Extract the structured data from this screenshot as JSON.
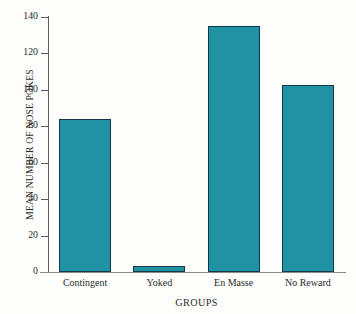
{
  "chart_data": {
    "type": "bar",
    "title": "",
    "subtitle": "",
    "xlabel": "GROUPS",
    "ylabel": "MEAN NUMBER OF NOSE POKES",
    "categories": [
      "Contingent",
      "Yoked",
      "En Masse",
      "No Reward"
    ],
    "values": [
      84,
      3.3,
      135,
      102.6
    ],
    "series": [
      {
        "name": "Mean number of nose pokes",
        "values": [
          84,
          3.3,
          135,
          102.6
        ]
      }
    ],
    "ylim": [
      0,
      140
    ],
    "yticks": [
      0,
      20,
      40,
      60,
      80,
      100,
      120,
      140
    ],
    "ytick_labels": [
      "0",
      "20",
      "40",
      "60",
      "80",
      "100",
      "120",
      "140"
    ],
    "grid": false,
    "legend": false,
    "legend_position": "none",
    "bar_color": "#1F93A4",
    "bar_edge_color": "#123A46",
    "axis_color": "#5C5C5C",
    "background_color": "#FDFDFB",
    "text_color": "#2B2B2B"
  }
}
